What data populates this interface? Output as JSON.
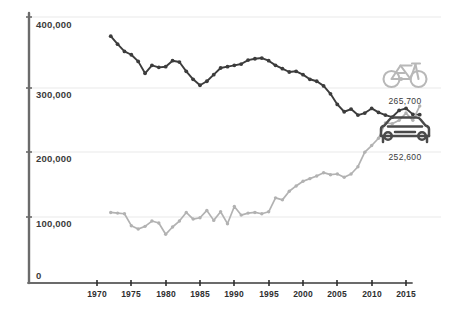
{
  "chart_data": {
    "type": "line",
    "title": "",
    "subtitle": "",
    "xlabel": "",
    "ylabel": "",
    "xlim": [
      1970,
      2018
    ],
    "ylim": [
      0,
      400000
    ],
    "grid": true,
    "legend_position": "inline-right-icons",
    "y_ticks": [
      "0",
      "100,000",
      "200,000",
      "300,000",
      "400,000"
    ],
    "y_tick_values": [
      0,
      100000,
      200000,
      300000,
      400000
    ],
    "x_ticks": [
      "1970",
      "1975",
      "1980",
      "1985",
      "1990",
      "1995",
      "2000",
      "2005",
      "2010",
      "2015"
    ],
    "x_tick_values": [
      1970,
      1975,
      1980,
      1985,
      1990,
      1995,
      2000,
      2005,
      2010,
      2015
    ],
    "series": [
      {
        "name": "car",
        "icon": "car-icon",
        "color": "#3c3c3c",
        "end_label": "252,600",
        "x": [
          1972,
          1973,
          1974,
          1975,
          1976,
          1977,
          1978,
          1979,
          1980,
          1981,
          1982,
          1983,
          1984,
          1985,
          1986,
          1987,
          1988,
          1989,
          1990,
          1991,
          1992,
          1993,
          1994,
          1995,
          1996,
          1997,
          1998,
          1999,
          2000,
          2001,
          2002,
          2003,
          2004,
          2005,
          2006,
          2007,
          2008,
          2009,
          2010,
          2011,
          2012,
          2013,
          2014,
          2015,
          2016,
          2017
        ],
        "values": [
          371000,
          359000,
          348000,
          343000,
          333000,
          315000,
          327000,
          324000,
          325000,
          334000,
          332000,
          318000,
          306000,
          297000,
          303000,
          313000,
          323000,
          325000,
          327000,
          329000,
          335000,
          337000,
          338000,
          334000,
          327000,
          322000,
          317000,
          318000,
          313000,
          306000,
          303000,
          296000,
          284000,
          268000,
          257000,
          261000,
          252000,
          255000,
          262000,
          256000,
          252000,
          249000,
          259000,
          262000,
          253000,
          252600
        ]
      },
      {
        "name": "bicycle",
        "icon": "bicycle-icon",
        "color": "#b2b2b2",
        "end_label": "265,700",
        "x": [
          1972,
          1973,
          1974,
          1975,
          1976,
          1977,
          1978,
          1979,
          1980,
          1981,
          1982,
          1983,
          1984,
          1985,
          1986,
          1987,
          1988,
          1989,
          1990,
          1991,
          1992,
          1993,
          1994,
          1995,
          1996,
          1997,
          1998,
          1999,
          2000,
          2001,
          2002,
          2003,
          2004,
          2005,
          2006,
          2007,
          2008,
          2009,
          2010,
          2011,
          2012,
          2013,
          2014,
          2015,
          2016,
          2017
        ],
        "values": [
          105000,
          104000,
          103000,
          85000,
          80000,
          84000,
          92000,
          89000,
          72000,
          83000,
          92000,
          105000,
          95000,
          97000,
          108000,
          93000,
          106000,
          88000,
          114000,
          101000,
          104000,
          105000,
          103000,
          106000,
          127000,
          124000,
          137000,
          145000,
          152000,
          156000,
          160000,
          165000,
          162000,
          163000,
          158000,
          163000,
          174000,
          196000,
          206000,
          217000,
          240000,
          239000,
          244000,
          255000,
          244000,
          265700
        ]
      }
    ]
  }
}
